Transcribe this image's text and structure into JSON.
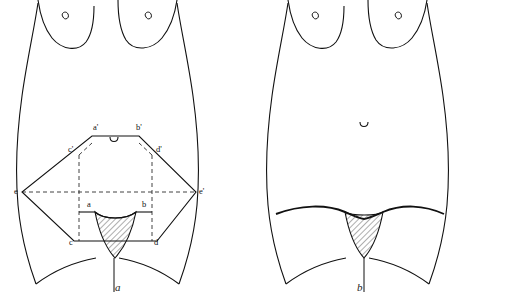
{
  "figure": {
    "type": "line-diagram",
    "title": "",
    "background": "#ffffff",
    "stroke_color": "#111111",
    "hatch_color": "#333333",
    "panels": [
      {
        "id": "a",
        "caption": "a",
        "labels": [
          {
            "key": "a_prime",
            "text": "a'",
            "x": 93,
            "y": 129
          },
          {
            "key": "b_prime",
            "text": "b'",
            "x": 136,
            "y": 129
          },
          {
            "key": "c_prime",
            "text": "c'",
            "x": 70,
            "y": 150
          },
          {
            "key": "d_prime",
            "text": "d'",
            "x": 158,
            "y": 150
          },
          {
            "key": "e_left",
            "text": "e",
            "x": 18,
            "y": 192
          },
          {
            "key": "e_prime",
            "text": "e'",
            "x": 204,
            "y": 192
          },
          {
            "key": "a",
            "text": "a",
            "x": 89,
            "y": 205
          },
          {
            "key": "b",
            "text": "b",
            "x": 144,
            "y": 205
          },
          {
            "key": "c",
            "text": "c",
            "x": 71,
            "y": 243
          },
          {
            "key": "d",
            "text": "d",
            "x": 156,
            "y": 243
          }
        ]
      },
      {
        "id": "b",
        "caption": "b",
        "labels": []
      }
    ]
  }
}
